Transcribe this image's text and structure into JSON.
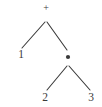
{
  "figure": {
    "expression": "1 + (2 • 3)",
    "background_color": "#ffffff",
    "stroke_color": "#3a3a3a",
    "text_color": "#3a3a3a"
  },
  "nodes": [
    {
      "id": "root",
      "label": "+",
      "kind": "operator",
      "semantic": "plus-operator",
      "x": 46,
      "y": 9
    },
    {
      "id": "left-leaf",
      "label": "1",
      "kind": "leaf",
      "semantic": "operand-1",
      "x": 21,
      "y": 55
    },
    {
      "id": "right-operator",
      "label": "•",
      "kind": "operator",
      "semantic": "multiply-operator",
      "x": 68,
      "y": 57
    },
    {
      "id": "right-left-leaf",
      "label": "2",
      "kind": "leaf",
      "semantic": "operand-2",
      "x": 45,
      "y": 98
    },
    {
      "id": "right-right-leaf",
      "label": "3",
      "kind": "leaf",
      "semantic": "operand-3",
      "x": 91,
      "y": 98
    }
  ],
  "edges": [
    {
      "id": "edge-root-left",
      "from": "root",
      "to": "left-leaf",
      "x1": 45,
      "y1": 22,
      "x2": 22,
      "y2": 48
    },
    {
      "id": "edge-root-right",
      "from": "root",
      "to": "right-operator",
      "x1": 47,
      "y1": 22,
      "x2": 67,
      "y2": 50
    },
    {
      "id": "edge-mul-left",
      "from": "right-operator",
      "to": "right-left-leaf",
      "x1": 67,
      "y1": 66,
      "x2": 47,
      "y2": 90
    },
    {
      "id": "edge-mul-right",
      "from": "right-operator",
      "to": "right-right-leaf",
      "x1": 69,
      "y1": 66,
      "x2": 90,
      "y2": 90
    }
  ]
}
